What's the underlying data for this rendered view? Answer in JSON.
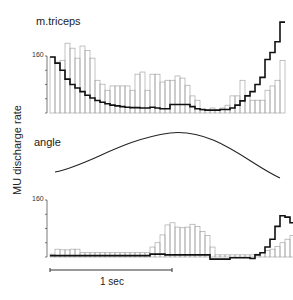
{
  "chart_data": [
    {
      "type": "bar",
      "title": "m.triceps",
      "ylabel": "MU discharge rate",
      "ytick_label": "160",
      "ylim": [
        0,
        300
      ],
      "bar_width_px": 5,
      "histogram_values": [
        157,
        143,
        148,
        196,
        182,
        154,
        188,
        176,
        154,
        92,
        81,
        64,
        76,
        76,
        76,
        76,
        64,
        109,
        115,
        64,
        109,
        109,
        87,
        92,
        92,
        104,
        98,
        78,
        48,
        36,
        8,
        8,
        14,
        8,
        14,
        22,
        48,
        48,
        92,
        50,
        36,
        36,
        36,
        64,
        76,
        92,
        148
      ],
      "bold_line_values": [
        157,
        140,
        120,
        95,
        80,
        70,
        60,
        50,
        42,
        35,
        30,
        26,
        22,
        20,
        18,
        16,
        15,
        15,
        14,
        14,
        16,
        14,
        12,
        12,
        24,
        24,
        24,
        24,
        18,
        12,
        10,
        8,
        8,
        8,
        10,
        10,
        14,
        22,
        34,
        48,
        60,
        80,
        100,
        150,
        170,
        200,
        255
      ]
    },
    {
      "type": "line",
      "title": "angle",
      "description": "smooth bell-shaped joint angle trace, peaking mid-record"
    },
    {
      "type": "bar",
      "title": "",
      "ytick_label": "160",
      "ylim": [
        0,
        160
      ],
      "bar_width_px": 5,
      "histogram_values": [
        8,
        22,
        20,
        20,
        22,
        22,
        12,
        12,
        12,
        12,
        12,
        12,
        12,
        12,
        12,
        12,
        12,
        12,
        12,
        12,
        28,
        40,
        62,
        90,
        96,
        84,
        82,
        84,
        92,
        86,
        72,
        60,
        28,
        6,
        6,
        6,
        6,
        6,
        6,
        6,
        6,
        8,
        12,
        18,
        22,
        30,
        40,
        50,
        60,
        68,
        76
      ],
      "bold_line_values": [
        4,
        4,
        4,
        4,
        4,
        4,
        4,
        4,
        4,
        4,
        4,
        4,
        4,
        4,
        4,
        4,
        4,
        4,
        4,
        4,
        8,
        8,
        8,
        6,
        6,
        6,
        6,
        6,
        6,
        6,
        6,
        6,
        -6,
        -6,
        -6,
        -6,
        -2,
        -2,
        -2,
        -2,
        -4,
        6,
        12,
        28,
        50,
        86,
        116,
        112,
        96,
        130,
        136
      ]
    }
  ],
  "labels": {
    "top_title": "m.triceps",
    "middle_title": "angle",
    "y_axis": "MU discharge rate",
    "top_tick": "160",
    "bottom_tick": "160",
    "scale_bar": "1 sec"
  }
}
